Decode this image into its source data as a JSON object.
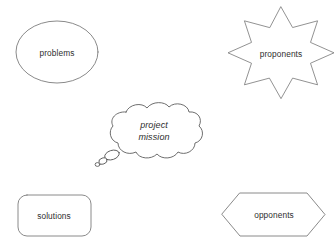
{
  "canvas": {
    "width": 336,
    "height": 250,
    "background": "#ffffff",
    "stroke_color": "#7d7d7d",
    "text_color": "#2e2e2e"
  },
  "shapes": [
    {
      "name": "ellipse-problems",
      "shape": "ellipse",
      "label": "problems",
      "center_x": 57,
      "center_y": 52
    },
    {
      "name": "star-proponents",
      "shape": "8-point-star",
      "label": "proponents",
      "center_x": 281,
      "center_y": 54
    },
    {
      "name": "cloud-project-mission",
      "shape": "thought-cloud",
      "label_line1": "project",
      "label_line2": "mission",
      "center_x": 154,
      "center_y": 131
    },
    {
      "name": "rounded-rect-solutions",
      "shape": "rounded-rectangle",
      "label": "solutions",
      "center_x": 54,
      "center_y": 215
    },
    {
      "name": "hexagon-opponents",
      "shape": "hexagon",
      "label": "opponents",
      "center_x": 273,
      "center_y": 215
    }
  ]
}
